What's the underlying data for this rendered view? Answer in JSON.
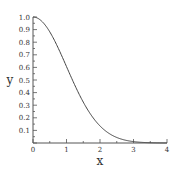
{
  "chart_data": {
    "type": "line",
    "title": "",
    "xlabel": "x",
    "ylabel": "y",
    "xlim": [
      0,
      4
    ],
    "ylim": [
      0,
      1.0
    ],
    "grid": false,
    "legend": null,
    "x_ticks": [
      "0",
      "1",
      "2",
      "3",
      "4"
    ],
    "y_ticks": [
      "0.1",
      "0.2",
      "0.3",
      "0.4",
      "0.5",
      "0.6",
      "0.7",
      "0.8",
      "0.9",
      "1.0"
    ],
    "series": [
      {
        "name": "y = exp(-x^2/2)",
        "x": [
          0,
          0.25,
          0.5,
          0.75,
          1.0,
          1.25,
          1.5,
          1.75,
          2.0,
          2.25,
          2.5,
          2.75,
          3.0,
          3.25,
          3.5,
          3.75,
          4.0
        ],
        "values": [
          1.0,
          0.969,
          0.882,
          0.755,
          0.607,
          0.458,
          0.325,
          0.216,
          0.135,
          0.08,
          0.044,
          0.023,
          0.011,
          0.005,
          0.002,
          0.001,
          0.0003
        ]
      }
    ],
    "color": "#444444"
  }
}
